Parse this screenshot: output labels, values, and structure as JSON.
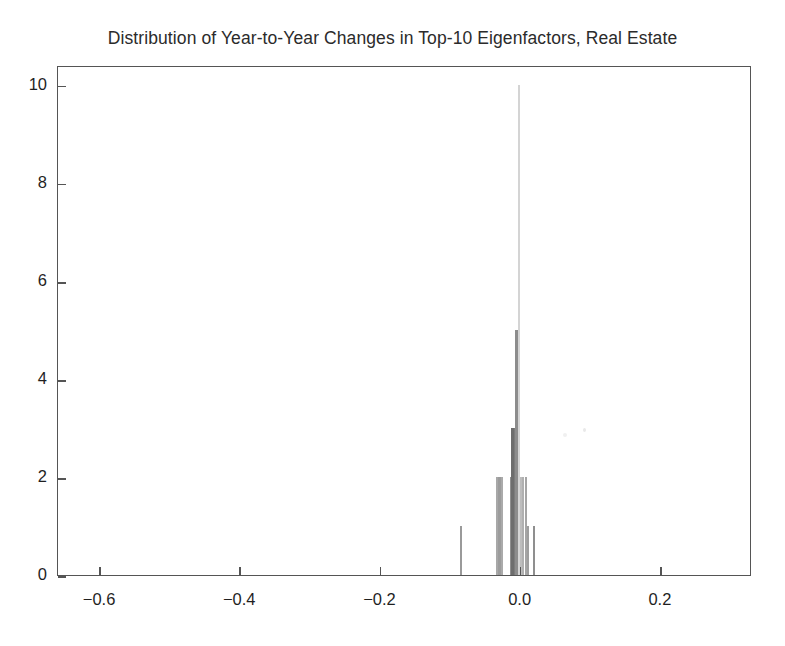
{
  "chart_data": {
    "type": "bar",
    "title": "Distribution of Year-to-Year Changes in Top-10 Eigenfactors, Real Estate",
    "subtitle": "",
    "xlabel": "",
    "ylabel": "",
    "xlim": [
      -0.66,
      0.33
    ],
    "ylim": [
      0,
      10.4
    ],
    "grid": false,
    "legend": "none",
    "bin_width": 0.004,
    "x_ticks": [
      -0.6,
      -0.4,
      -0.2,
      0.0,
      0.2
    ],
    "x_tick_labels": [
      "−0.6",
      "−0.4",
      "−0.2",
      "0.0",
      "0.2"
    ],
    "y_ticks": [
      0,
      2,
      4,
      6,
      8,
      10
    ],
    "y_tick_labels": [
      "0",
      "2",
      "4",
      "6",
      "8",
      "10"
    ],
    "bar_color": "#8a8a8a",
    "frame_color": "#555555",
    "background": "#ffffff",
    "categories": [
      -0.085,
      -0.034,
      -0.03,
      -0.026,
      -0.014,
      -0.011,
      -0.008,
      -0.005,
      -0.002,
      0.001,
      0.004,
      0.008,
      0.011,
      0.019
    ],
    "values": [
      1,
      2,
      2,
      2,
      2,
      3,
      3,
      5,
      10,
      2,
      2,
      2,
      1,
      1
    ],
    "bars": [
      {
        "x": -0.085,
        "height": 1,
        "width_px": 2.0,
        "color": "#9a9a9a"
      },
      {
        "x": -0.034,
        "height": 2,
        "width_px": 2.0,
        "color": "#a8a8a8"
      },
      {
        "x": -0.03,
        "height": 2,
        "width_px": 2.5,
        "color": "#9c9c9c"
      },
      {
        "x": -0.026,
        "height": 2,
        "width_px": 2.0,
        "color": "#aaaaaa"
      },
      {
        "x": -0.014,
        "height": 2,
        "width_px": 2.5,
        "color": "#8e8e8e"
      },
      {
        "x": -0.011,
        "height": 3,
        "width_px": 3.0,
        "color": "#6d6d6d"
      },
      {
        "x": -0.008,
        "height": 3,
        "width_px": 3.0,
        "color": "#7b7b7b"
      },
      {
        "x": -0.005,
        "height": 5,
        "width_px": 3.5,
        "color": "#8c8c8c"
      },
      {
        "x": -0.002,
        "height": 10,
        "width_px": 2.0,
        "color": "#d4d4d4"
      },
      {
        "x": 0.001,
        "height": 2,
        "width_px": 2.0,
        "color": "#bdbdbd"
      },
      {
        "x": 0.004,
        "height": 2,
        "width_px": 2.0,
        "color": "#b0b0b0"
      },
      {
        "x": 0.008,
        "height": 2,
        "width_px": 2.0,
        "color": "#a5a5a5"
      },
      {
        "x": 0.011,
        "height": 1,
        "width_px": 2.0,
        "color": "#9e9e9e"
      },
      {
        "x": 0.019,
        "height": 1,
        "width_px": 2.0,
        "color": "#8f8f8f"
      }
    ]
  }
}
